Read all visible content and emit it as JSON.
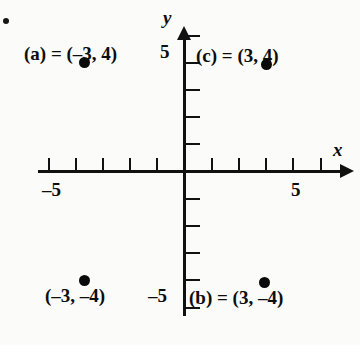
{
  "chart_data": {
    "type": "scatter",
    "title": "",
    "xlabel": "x",
    "ylabel": "y",
    "xlim": [
      -6,
      6
    ],
    "ylim": [
      -6,
      6
    ],
    "grid": false,
    "legend": null,
    "x_ticks": [
      -5,
      -4,
      -3,
      -2,
      -1,
      1,
      2,
      3,
      4,
      5
    ],
    "y_ticks": [
      -5,
      -4,
      -3,
      -2,
      -1,
      1,
      2,
      3,
      4,
      5
    ],
    "x_tick_labels_shown": [
      "-5",
      "5"
    ],
    "y_tick_labels_shown": [
      "5",
      "-5"
    ],
    "points": [
      {
        "id": "a",
        "x": -3,
        "y": 4,
        "label": "(a) = (–3, 4)"
      },
      {
        "id": "c",
        "x": 3,
        "y": 4,
        "label": "(c) = (3, 4)"
      },
      {
        "id": "d",
        "x": -3,
        "y": -4,
        "label": "(–3, –4)"
      },
      {
        "id": "b",
        "x": 3,
        "y": -4,
        "label": "(b) = (3, –4)"
      }
    ]
  },
  "axis": {
    "x_name": "x",
    "y_name": "y",
    "x_negative_label": "–5",
    "x_positive_label": "5",
    "y_positive_label": "5",
    "y_negative_label": "–5"
  },
  "colors": {
    "ink": "#111111",
    "point": "#0a0a0a",
    "paper": "#fbfbfa"
  }
}
